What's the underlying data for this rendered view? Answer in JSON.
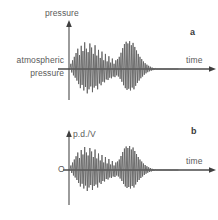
{
  "figure": {
    "background_color": "#ffffff",
    "line_color": "#555555",
    "axis_color": "#4a4a4a"
  },
  "panels": [
    {
      "letter": "a",
      "y_axis_label": "pressure",
      "x_axis_label": "time",
      "baseline_label_line1": "atmospheric",
      "baseline_label_line2": "pressure",
      "origin_label": ""
    },
    {
      "letter": "b",
      "y_axis_label": "p.d./V",
      "x_axis_label": "time",
      "baseline_label_line1": "",
      "baseline_label_line2": "",
      "origin_label": "O"
    }
  ],
  "chart_data": {
    "type": "line",
    "title": "",
    "charts": [
      {
        "letter": "a",
        "xlabel": "time",
        "ylabel": "pressure",
        "baseline_label": "atmospheric pressure",
        "grid": false,
        "legend": false,
        "xlim": [
          0,
          100
        ],
        "ylim": [
          -1,
          1
        ],
        "series": [
          {
            "name": "pressure waveform",
            "x": [
              0,
              0.8,
              1.6,
              2.4,
              3.2,
              4,
              4.8,
              5.6,
              6.4,
              7.2,
              8,
              8.8,
              9.6,
              10.4,
              11.2,
              12,
              12.8,
              13.6,
              14.4,
              15.2,
              16,
              16.8,
              17.6,
              18.4,
              19.2,
              20,
              20.8,
              21.6,
              22.4,
              23.2,
              24,
              24.8,
              25.6,
              26.4,
              27.2,
              28,
              28.8,
              29.6,
              30.4,
              31.2,
              32,
              32.8,
              33.6,
              34.4,
              35.2,
              36,
              36.8,
              37.6,
              38.4,
              39.2,
              40,
              40.8,
              41.6,
              42.4,
              43.2,
              44,
              44.8,
              45.6,
              46.4,
              47.2,
              48,
              48.8,
              49.6,
              50.4,
              51.2,
              52,
              52.8,
              53.6,
              54.4,
              55.2,
              56,
              56.8,
              57.6,
              58.4,
              59.2,
              60,
              60.8,
              61.6,
              62.4,
              63.2,
              64,
              64.8,
              65.6,
              66.4,
              67.2,
              68,
              68.8,
              69.6,
              70.4,
              71.2,
              72,
              72.8,
              73.6,
              74.4,
              75.2,
              76,
              76.8,
              77.6,
              78.4,
              79.2,
              80,
              82,
              84,
              86,
              88,
              90,
              92,
              94,
              96,
              98,
              100
            ],
            "y": [
              0,
              0.18,
              -0.12,
              0.3,
              -0.22,
              0.42,
              -0.3,
              0.55,
              -0.4,
              0.7,
              -0.52,
              0.48,
              -0.66,
              0.8,
              -0.55,
              0.62,
              -0.74,
              0.92,
              -0.62,
              0.7,
              -0.84,
              0.58,
              -0.7,
              0.88,
              -0.6,
              0.74,
              -0.8,
              0.52,
              -0.64,
              0.82,
              -0.58,
              0.46,
              -0.7,
              0.66,
              -0.5,
              0.38,
              -0.56,
              0.6,
              -0.44,
              0.3,
              -0.46,
              0.52,
              -0.36,
              0.26,
              -0.38,
              0.44,
              -0.3,
              0.22,
              -0.32,
              0.36,
              -0.26,
              0.18,
              -0.28,
              0.3,
              -0.22,
              0.34,
              -0.26,
              0.42,
              -0.34,
              0.56,
              -0.44,
              0.72,
              -0.56,
              0.86,
              -0.66,
              0.94,
              -0.72,
              0.88,
              -0.68,
              0.96,
              -0.74,
              0.82,
              -0.64,
              0.9,
              -0.7,
              0.76,
              -0.58,
              0.64,
              -0.48,
              0.52,
              -0.4,
              0.42,
              -0.32,
              0.34,
              -0.26,
              0.26,
              -0.2,
              0.2,
              -0.15,
              0.15,
              -0.11,
              0.11,
              -0.08,
              0.08,
              -0.06,
              0.05,
              -0.04,
              0.03,
              -0.02,
              0.02,
              0,
              0,
              0,
              0,
              0,
              0,
              0,
              0,
              0,
              0,
              0
            ]
          }
        ]
      },
      {
        "letter": "b",
        "xlabel": "time",
        "ylabel": "p.d./V",
        "baseline_label": "O",
        "grid": false,
        "legend": false,
        "xlim": [
          0,
          100
        ],
        "ylim": [
          -1,
          1
        ],
        "series": [
          {
            "name": "p.d. waveform",
            "x": [
              0,
              0.8,
              1.6,
              2.4,
              3.2,
              4,
              4.8,
              5.6,
              6.4,
              7.2,
              8,
              8.8,
              9.6,
              10.4,
              11.2,
              12,
              12.8,
              13.6,
              14.4,
              15.2,
              16,
              16.8,
              17.6,
              18.4,
              19.2,
              20,
              20.8,
              21.6,
              22.4,
              23.2,
              24,
              24.8,
              25.6,
              26.4,
              27.2,
              28,
              28.8,
              29.6,
              30.4,
              31.2,
              32,
              32.8,
              33.6,
              34.4,
              35.2,
              36,
              36.8,
              37.6,
              38.4,
              39.2,
              40,
              40.8,
              41.6,
              42.4,
              43.2,
              44,
              44.8,
              45.6,
              46.4,
              47.2,
              48,
              48.8,
              49.6,
              50.4,
              51.2,
              52,
              52.8,
              53.6,
              54.4,
              55.2,
              56,
              56.8,
              57.6,
              58.4,
              59.2,
              60,
              60.8,
              61.6,
              62.4,
              63.2,
              64,
              64.8,
              65.6,
              66.4,
              67.2,
              68,
              68.8,
              69.6,
              70.4,
              71.2,
              72,
              72.8,
              73.6,
              74.4,
              75.2,
              76,
              76.8,
              77.6,
              78.4,
              79.2,
              80,
              82,
              84,
              86,
              88,
              90,
              92,
              94,
              96,
              98,
              100
            ],
            "y": [
              0,
              0.18,
              -0.12,
              0.3,
              -0.22,
              0.42,
              -0.3,
              0.55,
              -0.4,
              0.7,
              -0.52,
              0.48,
              -0.66,
              0.8,
              -0.55,
              0.62,
              -0.74,
              0.92,
              -0.62,
              0.7,
              -0.84,
              0.58,
              -0.7,
              0.88,
              -0.6,
              0.74,
              -0.8,
              0.52,
              -0.64,
              0.82,
              -0.58,
              0.46,
              -0.7,
              0.66,
              -0.5,
              0.38,
              -0.56,
              0.6,
              -0.44,
              0.3,
              -0.46,
              0.52,
              -0.36,
              0.26,
              -0.38,
              0.44,
              -0.3,
              0.22,
              -0.32,
              0.36,
              -0.26,
              0.18,
              -0.28,
              0.3,
              -0.22,
              0.34,
              -0.26,
              0.42,
              -0.34,
              0.56,
              -0.44,
              0.72,
              -0.56,
              0.86,
              -0.66,
              0.94,
              -0.72,
              0.88,
              -0.68,
              0.96,
              -0.74,
              0.82,
              -0.64,
              0.9,
              -0.7,
              0.76,
              -0.58,
              0.64,
              -0.48,
              0.52,
              -0.4,
              0.42,
              -0.32,
              0.34,
              -0.26,
              0.26,
              -0.2,
              0.2,
              -0.15,
              0.15,
              -0.11,
              0.11,
              -0.08,
              0.08,
              -0.06,
              0.05,
              -0.04,
              0.03,
              -0.02,
              0.02,
              0,
              0,
              0,
              0,
              0,
              0,
              0,
              0,
              0,
              0,
              0
            ]
          }
        ]
      }
    ]
  }
}
